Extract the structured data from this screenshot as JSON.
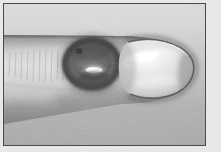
{
  "figure": {
    "kind": "clinical-photograph",
    "modality": "grayscale photograph",
    "caption": "",
    "orientation": "finger entering from left edge, tip pointing right"
  },
  "frame": {
    "plate_color": "#e8e8e8",
    "rule_color": "#4a4a4a",
    "rule_width_px": 1,
    "inset_px": 3
  },
  "scene": {
    "background": {
      "name": "studio-backdrop",
      "upper_tone": "#d4d4d4",
      "lower_tone": "#a9a9a9",
      "description": "plain flat gray backdrop, lighter above the finger and darker below"
    },
    "finger": {
      "name": "index-fingertip",
      "skin_tone_light": "#d8d2cb",
      "skin_tone_mid": "#b5ada5",
      "skin_tone_shadow": "#7e766f",
      "top_edge_y": 31,
      "bottom_edge_left_y": 120,
      "bottom_edge_right_y": 99,
      "tip_x": 191,
      "texture": "fine transverse skin creases across the mid-shaft of the digit"
    },
    "lesion": {
      "name": "annular-crusted-lesion",
      "center_x": 88,
      "center_y": 60,
      "radius_x": 30,
      "radius_y": 27,
      "rim_tone": "#4b433d",
      "core_tone": "#6a615a",
      "highlight_tone": "#efe9df",
      "description": "round dark hyperpigmented plaque with a raised rolled border and a pale glistening crust at its centre"
    },
    "nail": {
      "name": "fingernail",
      "body_tone": "#e3ded6",
      "outline_tone": "#524b45",
      "specular_tone": "#fbf8f2",
      "center_x": 150,
      "center_y": 63,
      "radius_x": 40,
      "radius_y": 31,
      "description": "bright convex nail plate with dark free-edge outline and a broad specular highlight"
    }
  }
}
